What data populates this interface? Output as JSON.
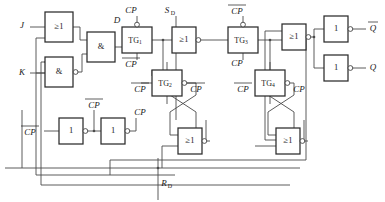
{
  "figure": {
    "type": "schematic"
  },
  "inputs": [
    {
      "id": "J",
      "label": "J",
      "x": 22,
      "y": 26
    },
    {
      "id": "K",
      "label": "K",
      "x": 22,
      "y": 73
    },
    {
      "id": "SD",
      "label": "S",
      "sub": "D",
      "x": 169,
      "y": 11
    },
    {
      "id": "RD",
      "label": "R",
      "sub": "D",
      "x": 151,
      "y": 189
    },
    {
      "id": "CPin",
      "label": "CP",
      "overline": true,
      "x": 28,
      "y": 132
    }
  ],
  "outputs": [
    {
      "id": "Qbar",
      "label": "Q",
      "overline": true,
      "x": 375,
      "y": 29
    },
    {
      "id": "Q",
      "label": "Q",
      "overline": false,
      "x": 375,
      "y": 68
    }
  ],
  "gates": [
    {
      "id": "or1",
      "name": "or-gate-j",
      "label": "≥1",
      "x": 45,
      "y": 12,
      "w": 28,
      "h": 30,
      "bubble": false
    },
    {
      "id": "and1",
      "name": "and-gate-k",
      "label": "&",
      "x": 45,
      "y": 57,
      "w": 28,
      "h": 30,
      "bubble": true
    },
    {
      "id": "and2",
      "name": "and-gate-d",
      "label": "&",
      "x": 87,
      "y": 32,
      "w": 28,
      "h": 30,
      "bubble": false
    },
    {
      "id": "or2",
      "name": "or-gate-set",
      "label": "≥1",
      "x": 172,
      "y": 27,
      "w": 24,
      "h": 26,
      "bubble": true
    },
    {
      "id": "or3",
      "name": "or-gate-q",
      "label": "≥1",
      "x": 282,
      "y": 24,
      "w": 24,
      "h": 26,
      "bubble": true
    },
    {
      "id": "or4",
      "name": "or-gate-reset-l",
      "label": "≥1",
      "x": 178,
      "y": 128,
      "w": 24,
      "h": 26,
      "bubble": true
    },
    {
      "id": "or5",
      "name": "or-gate-reset-r",
      "label": "≥1",
      "x": 276,
      "y": 128,
      "w": 24,
      "h": 26,
      "bubble": true
    },
    {
      "id": "inv1",
      "name": "inverter-cp-1",
      "label": "1",
      "x": 59,
      "y": 118,
      "w": 24,
      "h": 26,
      "bubble": true
    },
    {
      "id": "inv2",
      "name": "inverter-cp-2",
      "label": "1",
      "x": 101,
      "y": 118,
      "w": 24,
      "h": 26,
      "bubble": true
    },
    {
      "id": "inv3",
      "name": "inverter-qbar",
      "label": "1",
      "x": 324,
      "y": 16,
      "w": 24,
      "h": 26,
      "bubble": true
    },
    {
      "id": "inv4",
      "name": "inverter-q",
      "label": "1",
      "x": 324,
      "y": 55,
      "w": 24,
      "h": 26,
      "bubble": true
    }
  ],
  "transmission_gates": [
    {
      "id": "TG1",
      "label": "TG",
      "sub": "1",
      "x": 122,
      "y": 27,
      "w": 30,
      "h": 26,
      "top_label": "CP",
      "top_overline": false,
      "bottom_label": "CP",
      "bottom_overline": true,
      "left_label": "",
      "right_label": ""
    },
    {
      "id": "TG2",
      "label": "TG",
      "sub": "2",
      "x": 152,
      "y": 70,
      "w": 30,
      "h": 26,
      "top_label": "",
      "bottom_label": "",
      "left_label": "CP",
      "left_overline": true,
      "right_label": "CP",
      "right_overline": true
    },
    {
      "id": "TG3",
      "label": "TG",
      "sub": "3",
      "x": 228,
      "y": 27,
      "w": 30,
      "h": 26,
      "top_label": "CP",
      "top_overline": true,
      "bottom_label": "CP",
      "bottom_overline": false,
      "left_label": "",
      "right_label": ""
    },
    {
      "id": "TG4",
      "label": "TG",
      "sub": "4",
      "x": 255,
      "y": 70,
      "w": 30,
      "h": 26,
      "top_label": "",
      "bottom_label": "",
      "left_label": "CP",
      "left_overline": true,
      "right_label": "CP",
      "right_overline": false
    }
  ],
  "net_labels": [
    {
      "id": "D",
      "label": "D",
      "overline": false,
      "italic": true,
      "x": 117,
      "y": 28
    },
    {
      "id": "cpTG1",
      "label": "CP",
      "overline": false,
      "italic": true,
      "x": 131,
      "y": 11
    },
    {
      "id": "cpbTG1",
      "label": "CP",
      "overline": true,
      "italic": true,
      "x": 131,
      "y": 64
    },
    {
      "id": "cpbTG3",
      "label": "CP",
      "overline": true,
      "italic": true,
      "x": 237,
      "y": 11
    },
    {
      "id": "cpTG3",
      "label": "CP",
      "overline": false,
      "italic": true,
      "x": 237,
      "y": 64
    },
    {
      "id": "cpbTG2L",
      "label": "CP",
      "overline": true,
      "italic": true,
      "x": 140,
      "y": 84
    },
    {
      "id": "cpbTG2R",
      "label": "CP",
      "overline": true,
      "italic": true,
      "x": 194,
      "y": 84
    },
    {
      "id": "cpbTG4L",
      "label": "CP",
      "overline": true,
      "italic": true,
      "x": 243,
      "y": 84
    },
    {
      "id": "cpTG4R",
      "label": "CP",
      "overline": false,
      "italic": true,
      "x": 297,
      "y": 84
    },
    {
      "id": "cpbMid",
      "label": "CP",
      "overline": true,
      "italic": true,
      "x": 90,
      "y": 105
    },
    {
      "id": "cpMid",
      "label": "CP",
      "overline": false,
      "italic": true,
      "x": 136,
      "y": 113
    }
  ],
  "caption": ""
}
